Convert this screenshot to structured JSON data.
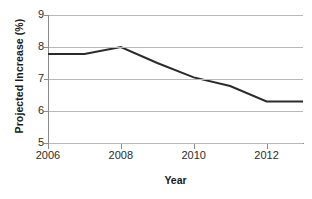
{
  "chart_data": {
    "type": "line",
    "title": "",
    "xlabel": "Year",
    "ylabel": "Projected Increase (%)",
    "x": [
      2006,
      2007,
      2008,
      2009,
      2010,
      2011,
      2012,
      2013
    ],
    "series": [
      {
        "name": "Projected Increase",
        "values": [
          7.78,
          7.78,
          8.0,
          7.5,
          7.05,
          6.78,
          6.3,
          6.3
        ],
        "color": "#2b2b2b",
        "line_width": 2
      }
    ],
    "xlim": [
      2006,
      2013
    ],
    "ylim": [
      5,
      9
    ],
    "ytick_labels": [
      "9",
      "8",
      "7",
      "6",
      "5"
    ],
    "ytick_values": [
      9,
      8,
      7,
      6,
      5
    ],
    "xtick_labels": [
      "2006",
      "2008",
      "2010",
      "2012"
    ],
    "xtick_values": [
      2006,
      2008,
      2010,
      2012
    ],
    "grid": true,
    "grid_axis": "y",
    "legend": false,
    "legend_position": "none",
    "gridline_color": "#b9b9b9",
    "axis_color": "#8c8c8c",
    "background_color": "#ffffff"
  }
}
